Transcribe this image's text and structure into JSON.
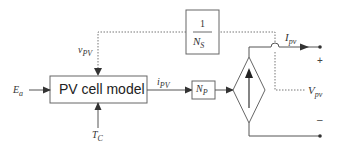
{
  "diagram": {
    "type": "block-diagram",
    "blocks": {
      "pv_cell_model": {
        "label": "PV cell model"
      },
      "np_gain": {
        "main": "N",
        "sub": "P"
      },
      "ns_gain": {
        "numerator": "1",
        "den_main": "N",
        "den_sub": "S"
      },
      "current_source": {
        "kind": "dependent current source (diamond)",
        "arrow": "up"
      }
    },
    "signals": {
      "ea": {
        "main": "E",
        "sub": "a"
      },
      "tc": {
        "main": "T",
        "sub": "C"
      },
      "v_pv_in": {
        "main": "v",
        "sub": "PV"
      },
      "i_pv_internal": {
        "main": "i",
        "sub": "PV"
      },
      "i_pv_out": {
        "main": "I",
        "sub": "pv"
      },
      "v_pv_out": {
        "main": "V",
        "sub": "pv"
      }
    },
    "terminals": {
      "plus": "+",
      "minus": "–"
    },
    "colors": {
      "line": "#555555",
      "dotted": "#777777",
      "box_border": "#666666",
      "text": "#333333"
    }
  }
}
